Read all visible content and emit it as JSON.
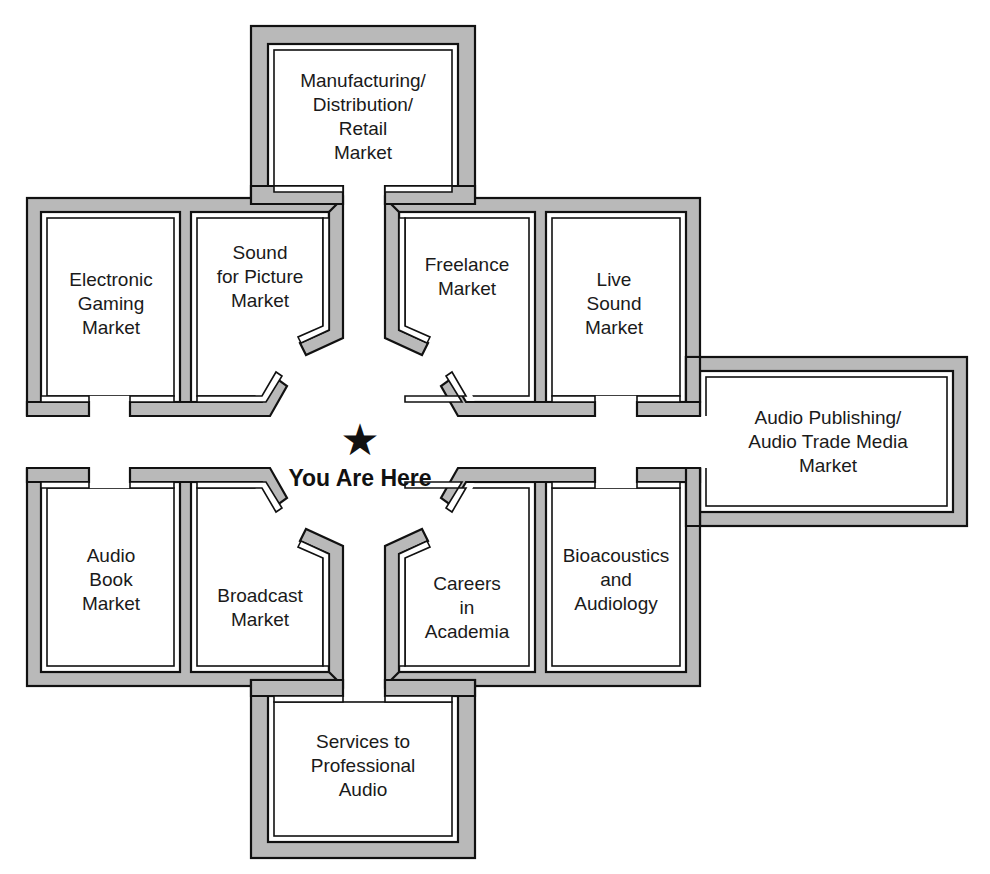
{
  "map": {
    "you_are_here": {
      "icon": "star-icon",
      "glyph": "★",
      "label": "You Are Here"
    },
    "rooms": [
      {
        "id": "manufacturing",
        "lines": [
          "Manufacturing/",
          "Distribution/",
          "Retail",
          "Market"
        ]
      },
      {
        "id": "electronic-gaming",
        "lines": [
          "Electronic",
          "Gaming",
          "Market"
        ]
      },
      {
        "id": "sound-for-picture",
        "lines": [
          "Sound",
          "for Picture",
          "Market"
        ]
      },
      {
        "id": "freelance",
        "lines": [
          "Freelance",
          "Market"
        ]
      },
      {
        "id": "live-sound",
        "lines": [
          "Live",
          "Sound",
          "Market"
        ]
      },
      {
        "id": "audio-publishing",
        "lines": [
          "Audio Publishing/",
          "Audio Trade Media",
          "Market"
        ]
      },
      {
        "id": "audio-book",
        "lines": [
          "Audio",
          "Book",
          "Market"
        ]
      },
      {
        "id": "broadcast",
        "lines": [
          "Broadcast",
          "Market"
        ]
      },
      {
        "id": "careers-academia",
        "lines": [
          "Careers",
          "in",
          "Academia"
        ]
      },
      {
        "id": "bioacoustics",
        "lines": [
          "Bioacoustics",
          "and",
          "Audiology"
        ]
      },
      {
        "id": "services-pro-audio",
        "lines": [
          "Services to",
          "Professional",
          "Audio"
        ]
      }
    ]
  },
  "colors": {
    "wall_fill": "#b9b9b9",
    "line": "#111111",
    "background": "#ffffff"
  }
}
